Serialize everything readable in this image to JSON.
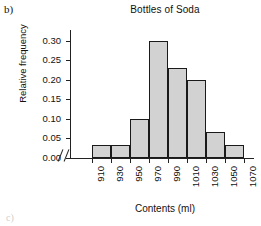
{
  "figure": {
    "panel_letter": "b)",
    "corner_mark": "c)"
  },
  "chart_data": {
    "type": "bar",
    "title": "Bottles of Soda",
    "xlabel": "Contents (ml)",
    "ylabel": "Relative frequency",
    "grid": false,
    "legend": "none",
    "ylim": [
      0.0,
      0.32
    ],
    "ytick_labels": [
      "0.00",
      "0.05",
      "0.10",
      "0.15",
      "0.20",
      "0.25",
      "0.30"
    ],
    "ytick_values": [
      0.0,
      0.05,
      0.1,
      0.15,
      0.2,
      0.25,
      0.3
    ],
    "xtick_labels": [
      "910",
      "930",
      "950",
      "970",
      "990",
      "1010",
      "1030",
      "1050",
      "1070"
    ],
    "xtick_values": [
      910,
      930,
      950,
      970,
      990,
      1010,
      1030,
      1050,
      1070
    ],
    "bin_width": 20,
    "bin_edges": [
      910,
      930,
      950,
      970,
      990,
      1010,
      1030,
      1050,
      1070
    ],
    "categories": [
      "910-930",
      "930-950",
      "950-970",
      "970-990",
      "990-1010",
      "1010-1030",
      "1030-1050",
      "1050-1070"
    ],
    "values": [
      0.033,
      0.033,
      0.1,
      0.3,
      0.23,
      0.2,
      0.067,
      0.033
    ],
    "bar_fill_color": "#d2d2d2",
    "bar_edge_color": "#1a1a1a",
    "axis_break": true
  }
}
